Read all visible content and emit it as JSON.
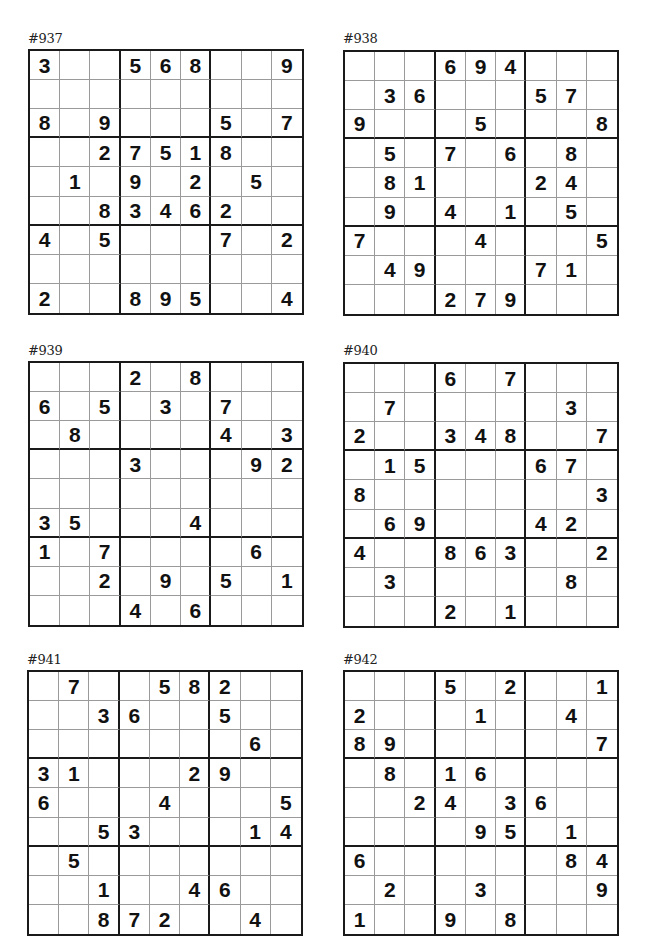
{
  "page": {
    "puzzles": [
      {
        "label": "#937",
        "grid": [
          [
            "3",
            "",
            "",
            "5",
            "6",
            "8",
            "",
            "",
            "9"
          ],
          [
            "",
            "",
            "",
            "",
            "",
            "",
            "",
            "",
            ""
          ],
          [
            "8",
            "",
            "9",
            "",
            "",
            "",
            "5",
            "",
            "7"
          ],
          [
            "",
            "",
            "2",
            "7",
            "5",
            "1",
            "8",
            "",
            ""
          ],
          [
            "",
            "1",
            "",
            "9",
            "",
            "2",
            "",
            "5",
            ""
          ],
          [
            "",
            "",
            "8",
            "3",
            "4",
            "6",
            "2",
            "",
            ""
          ],
          [
            "4",
            "",
            "5",
            "",
            "",
            "",
            "7",
            "",
            "2"
          ],
          [
            "",
            "",
            "",
            "",
            "",
            "",
            "",
            "",
            ""
          ],
          [
            "2",
            "",
            "",
            "8",
            "9",
            "5",
            "",
            "",
            "4"
          ]
        ]
      },
      {
        "label": "#938",
        "grid": [
          [
            "",
            "",
            "",
            "6",
            "9",
            "4",
            "",
            "",
            ""
          ],
          [
            "",
            "3",
            "6",
            "",
            "",
            "",
            "5",
            "7",
            ""
          ],
          [
            "9",
            "",
            "",
            "",
            "5",
            "",
            "",
            "",
            "8"
          ],
          [
            "",
            "5",
            "",
            "7",
            "",
            "6",
            "",
            "8",
            ""
          ],
          [
            "",
            "8",
            "1",
            "",
            "",
            "",
            "2",
            "4",
            ""
          ],
          [
            "",
            "9",
            "",
            "4",
            "",
            "1",
            "",
            "5",
            ""
          ],
          [
            "7",
            "",
            "",
            "",
            "4",
            "",
            "",
            "",
            "5"
          ],
          [
            "",
            "4",
            "9",
            "",
            "",
            "",
            "7",
            "1",
            ""
          ],
          [
            "",
            "",
            "",
            "2",
            "7",
            "9",
            "",
            "",
            ""
          ]
        ]
      },
      {
        "label": "#939",
        "grid": [
          [
            "",
            "",
            "",
            "2",
            "",
            "8",
            "",
            "",
            ""
          ],
          [
            "6",
            "",
            "5",
            "",
            "3",
            "",
            "7",
            "",
            ""
          ],
          [
            "",
            "8",
            "",
            "",
            "",
            "",
            "4",
            "",
            "3"
          ],
          [
            "",
            "",
            "",
            "3",
            "",
            "",
            "",
            "9",
            "2"
          ],
          [
            "",
            "",
            "",
            "",
            "",
            "",
            "",
            "",
            ""
          ],
          [
            "3",
            "5",
            "",
            "",
            "",
            "4",
            "",
            "",
            ""
          ],
          [
            "1",
            "",
            "7",
            "",
            "",
            "",
            "",
            "6",
            ""
          ],
          [
            "",
            "",
            "2",
            "",
            "9",
            "",
            "5",
            "",
            "1"
          ],
          [
            "",
            "",
            "",
            "4",
            "",
            "6",
            "",
            "",
            ""
          ]
        ]
      },
      {
        "label": "#940",
        "grid": [
          [
            "",
            "",
            "",
            "6",
            "",
            "7",
            "",
            "",
            ""
          ],
          [
            "",
            "7",
            "",
            "",
            "",
            "",
            "",
            "3",
            ""
          ],
          [
            "2",
            "",
            "",
            "3",
            "4",
            "8",
            "",
            "",
            "7"
          ],
          [
            "",
            "1",
            "5",
            "",
            "",
            "",
            "6",
            "7",
            ""
          ],
          [
            "8",
            "",
            "",
            "",
            "",
            "",
            "",
            "",
            "3"
          ],
          [
            "",
            "6",
            "9",
            "",
            "",
            "",
            "4",
            "2",
            ""
          ],
          [
            "4",
            "",
            "",
            "8",
            "6",
            "3",
            "",
            "",
            "2"
          ],
          [
            "",
            "3",
            "",
            "",
            "",
            "",
            "",
            "8",
            ""
          ],
          [
            "",
            "",
            "",
            "2",
            "",
            "1",
            "",
            "",
            ""
          ]
        ]
      },
      {
        "label": "#941",
        "grid": [
          [
            "",
            "7",
            "",
            "",
            "5",
            "8",
            "2",
            "",
            ""
          ],
          [
            "",
            "",
            "3",
            "6",
            "",
            "",
            "5",
            "",
            ""
          ],
          [
            "",
            "",
            "",
            "",
            "",
            "",
            "",
            "6",
            ""
          ],
          [
            "3",
            "1",
            "",
            "",
            "",
            "2",
            "9",
            "",
            ""
          ],
          [
            "6",
            "",
            "",
            "",
            "4",
            "",
            "",
            "",
            "5"
          ],
          [
            "",
            "",
            "5",
            "3",
            "",
            "",
            "",
            "1",
            "4"
          ],
          [
            "",
            "5",
            "",
            "",
            "",
            "",
            "",
            "",
            ""
          ],
          [
            "",
            "",
            "1",
            "",
            "",
            "4",
            "6",
            "",
            ""
          ],
          [
            "",
            "",
            "8",
            "7",
            "2",
            "",
            "",
            "4",
            ""
          ]
        ]
      },
      {
        "label": "#942",
        "grid": [
          [
            "",
            "",
            "",
            "5",
            "",
            "2",
            "",
            "",
            "1"
          ],
          [
            "2",
            "",
            "",
            "",
            "1",
            "",
            "",
            "4",
            ""
          ],
          [
            "8",
            "9",
            "",
            "",
            "",
            "",
            "",
            "",
            "7"
          ],
          [
            "",
            "8",
            "",
            "1",
            "6",
            "",
            "",
            "",
            ""
          ],
          [
            "",
            "",
            "2",
            "4",
            "",
            "3",
            "6",
            "",
            ""
          ],
          [
            "",
            "",
            "",
            "",
            "9",
            "5",
            "",
            "1",
            ""
          ],
          [
            "6",
            "",
            "",
            "",
            "",
            "",
            "",
            "8",
            "4"
          ],
          [
            "",
            "2",
            "",
            "",
            "3",
            "",
            "",
            "",
            "9"
          ],
          [
            "1",
            "",
            "",
            "9",
            "",
            "8",
            "",
            "",
            ""
          ]
        ]
      }
    ]
  }
}
